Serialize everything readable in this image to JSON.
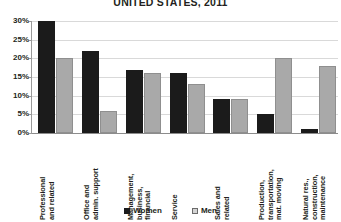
{
  "chart_data": {
    "type": "bar",
    "title": "UNITED STATES, 2011",
    "xlabel": "",
    "ylabel": "",
    "ylim": [
      0,
      30
    ],
    "ytick_labels": [
      "0%",
      "5%",
      "10%",
      "15%",
      "20%",
      "25%",
      "30%"
    ],
    "ytick_values": [
      0,
      5,
      10,
      15,
      20,
      25,
      30
    ],
    "grid": true,
    "legend_position": "bottom",
    "categories": [
      "Professional and related",
      "Office and admin. support",
      "Management, business, financial",
      "Service",
      "Sales and related",
      "Production, transportation, mat. moving",
      "Natural res., construction, maintenance"
    ],
    "category_lines": [
      [
        "Professional",
        "and related"
      ],
      [
        "Office and",
        "admin. support"
      ],
      [
        "Management,",
        "business,",
        "financial"
      ],
      [
        "Service"
      ],
      [
        "Sales and",
        "related"
      ],
      [
        "Production,",
        "transportation,",
        "mat. moving"
      ],
      [
        "Natural res.,",
        "construction,",
        "maintenance"
      ]
    ],
    "series": [
      {
        "name": "Women",
        "color": "#1b1b1b",
        "values": [
          30,
          22,
          17,
          16,
          9,
          5,
          1
        ]
      },
      {
        "name": "Men",
        "color": "#a9a9a9",
        "values": [
          20,
          6,
          16,
          13,
          9,
          20,
          18
        ]
      }
    ]
  },
  "legend": {
    "items": [
      {
        "label": "Women"
      },
      {
        "label": "Men"
      }
    ]
  }
}
